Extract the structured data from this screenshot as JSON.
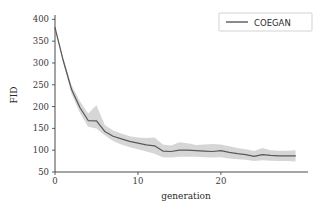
{
  "chart_data": {
    "type": "line",
    "title": "",
    "xlabel": "generation",
    "ylabel": "FID",
    "xlim": [
      0,
      30.5
    ],
    "ylim": [
      50,
      410
    ],
    "xticks": [
      0,
      10,
      20
    ],
    "xtick_labels": [
      "0",
      "10",
      "20"
    ],
    "yticks": [
      50,
      100,
      150,
      200,
      250,
      300,
      350,
      400
    ],
    "ytick_labels": [
      "50",
      "100",
      "150",
      "200",
      "250",
      "300",
      "350",
      "400"
    ],
    "grid": false,
    "legend_position": "upper right",
    "line_color": "#595959",
    "band_color": "#d6d6d6",
    "series": [
      {
        "name": "COEGAN",
        "x": [
          0,
          1,
          2,
          3,
          4,
          5,
          6,
          7,
          8,
          9,
          10,
          11,
          12,
          13,
          14,
          15,
          16,
          17,
          18,
          19,
          20,
          21,
          22,
          23,
          24,
          25,
          26,
          27,
          28,
          29
        ],
        "values": [
          381,
          305,
          239,
          198,
          168,
          167,
          143,
          132,
          126,
          120,
          116,
          112,
          110,
          98,
          97,
          100,
          100,
          99,
          98,
          97,
          99,
          95,
          92,
          90,
          86,
          90,
          88,
          87,
          87,
          87
        ],
        "lower": [
          381,
          300,
          229,
          186,
          154,
          150,
          134,
          121,
          113,
          107,
          102,
          97,
          92,
          84,
          83,
          85,
          85,
          85,
          84,
          83,
          84,
          81,
          79,
          78,
          75,
          77,
          76,
          75,
          75,
          74
        ],
        "upper": [
          381,
          310,
          249,
          212,
          184,
          203,
          158,
          145,
          138,
          132,
          129,
          128,
          129,
          113,
          111,
          118,
          116,
          112,
          113,
          114,
          113,
          109,
          105,
          102,
          98,
          105,
          100,
          99,
          99,
          100
        ]
      }
    ],
    "legend_entries": [
      {
        "label": "COEGAN",
        "color": "#595959"
      }
    ]
  },
  "legend": {
    "label": "COEGAN"
  },
  "axes": {
    "xlabel": "generation",
    "ylabel": "FID"
  }
}
